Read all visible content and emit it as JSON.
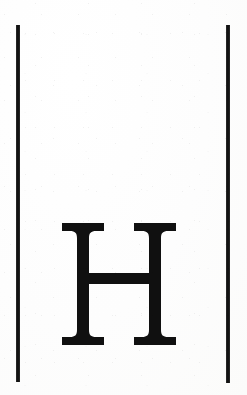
{
  "document": {
    "kind": "scanned-letter-plate",
    "background_color": "#fefefe",
    "ink_color": "#101010",
    "width_px": 247,
    "height_px": 395,
    "caption": ""
  },
  "letter": {
    "character": "H",
    "name": "capital-letter-h",
    "style": "didone-serif",
    "ink_color": "#101010",
    "bounds": {
      "left_px": 58,
      "top_px": 221,
      "width_px": 122,
      "height_px": 126
    }
  },
  "rules": [
    {
      "name": "left-vertical-rule",
      "color": "#121212",
      "left_px": 16,
      "top_px": 25,
      "width_px": 4,
      "height_px": 357
    },
    {
      "name": "right-vertical-rule",
      "color": "#121212",
      "left_px": 226,
      "top_px": 25,
      "width_px": 4,
      "height_px": 358
    }
  ],
  "glyph_geometry": {
    "comment": "path coordinates in a 122x126 viewBox matching the scanned H",
    "path": "M 4 2 L 46 2 L 46 10 L 38 10 C 33 10 31 12 31 17 L 31 52 L 91 52 L 91 17 C 91 12 89 10 84 10 L 76 10 L 76 2 L 118 2 L 118 10 L 110 10 C 105 10 103 12 103 17 L 103 109 C 103 114 105 116 110 116 L 118 116 L 118 124 L 76 124 L 76 116 L 84 116 C 89 116 91 114 91 109 L 91 63 L 31 63 L 31 109 C 31 114 33 116 38 116 L 46 116 L 46 124 L 4 124 L 4 116 L 12 116 C 17 116 19 114 19 109 L 19 17 C 19 12 17 10 12 10 L 4 10 Z"
  }
}
